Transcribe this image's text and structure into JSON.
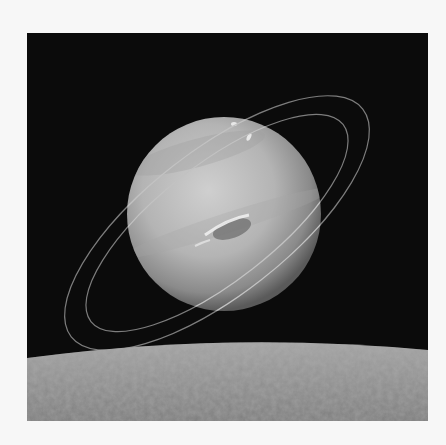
{
  "scene": {
    "subject": "ringed planet above moon horizon",
    "colors": {
      "page_background": "#f7f7f7",
      "space": "#0b0b0b",
      "planet_light": "#c9c9c9",
      "planet_dark": "#6e6e6e",
      "ring": "#8a8a8a",
      "moon_surface": "#8d8d8d"
    }
  }
}
